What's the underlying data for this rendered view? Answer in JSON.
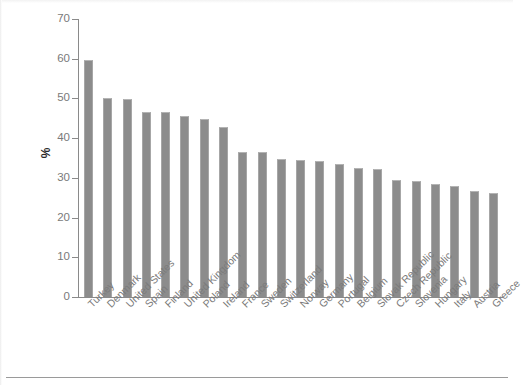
{
  "chart_data": {
    "type": "bar",
    "title": "",
    "subtitle": "",
    "xlabel": "",
    "ylabel": "%",
    "ylim": [
      0,
      70
    ],
    "yticks": [
      0,
      10,
      20,
      30,
      40,
      50,
      60,
      70
    ],
    "grid": false,
    "legend": null,
    "bar_color": "#8c8c8c",
    "categories": [
      "Turkey",
      "Denmark",
      "United States",
      "Spain",
      "Finland",
      "United Kingdom",
      "Poland",
      "Ireland",
      "France",
      "Sweden",
      "Switzerland",
      "Norway",
      "Germany",
      "Portugal",
      "Belgium",
      "Slovak Republic",
      "Czech Republic",
      "Slovenia",
      "Hungary",
      "Italy",
      "Austria",
      "Greece"
    ],
    "values": [
      59.7,
      50.1,
      49.8,
      46.7,
      46.5,
      45.6,
      44.8,
      42.8,
      36.6,
      36.4,
      34.7,
      34.6,
      34.3,
      33.6,
      32.6,
      32.3,
      29.5,
      29.3,
      28.4,
      28.0,
      26.8,
      26.1
    ]
  },
  "axis": {
    "y_title": "%",
    "tick_labels": [
      "70",
      "60",
      "50",
      "40",
      "30",
      "20",
      "10",
      "0"
    ]
  }
}
